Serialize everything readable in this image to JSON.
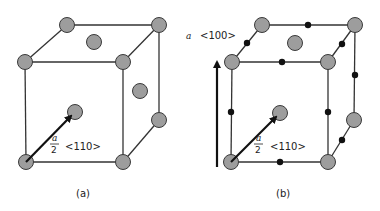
{
  "figure_a": {
    "caption": "(a)",
    "vector_fraction_numerator": "a",
    "vector_fraction_denominator": "2",
    "vector_direction": "<110>"
  },
  "figure_b": {
    "caption": "(b)",
    "vector_fraction_numerator": "a",
    "vector_fraction_denominator": "2",
    "vector_direction": "<110>",
    "burgers_label_prefix": "a",
    "burgers_label_direction": "<100>"
  },
  "colors": {
    "atom_fill": "#9d9d9d",
    "atom_stroke": "#3a3a3a",
    "interstitial_dot": "#111111",
    "edge": "#333333"
  }
}
